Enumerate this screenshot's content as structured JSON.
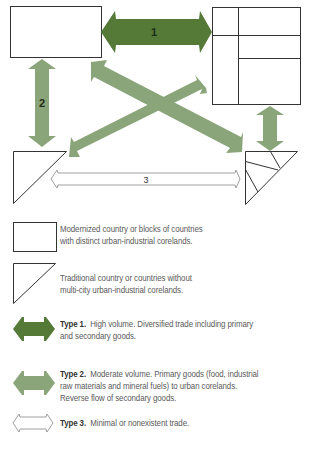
{
  "colors": {
    "type1_fill": "#557a38",
    "type2_fill": "#8ba57a",
    "type3_fill": "#ffffff",
    "outline": "#333333",
    "text": "#5a5a5a"
  },
  "diagram": {
    "arrow_labels": {
      "arrow1": "1",
      "arrow2": "2",
      "arrow3": "3"
    },
    "nodes": [
      {
        "id": "modern-left",
        "shape": "rectangle"
      },
      {
        "id": "modern-right-block",
        "shape": "rectangle-subdivided"
      },
      {
        "id": "traditional-left",
        "shape": "triangle"
      },
      {
        "id": "traditional-right-block",
        "shape": "triangle-subdivided"
      }
    ],
    "links": [
      {
        "from": "modern-left",
        "to": "modern-right-block",
        "type": "1",
        "label": "1"
      },
      {
        "from": "modern-left",
        "to": "traditional-left",
        "type": "2",
        "label": "2"
      },
      {
        "from": "modern-left",
        "to": "traditional-right-block",
        "type": "2",
        "label": ""
      },
      {
        "from": "traditional-left",
        "to": "modern-right-block",
        "type": "2",
        "label": ""
      },
      {
        "from": "modern-right-block",
        "to": "traditional-right-block",
        "type": "2",
        "label": ""
      },
      {
        "from": "traditional-left",
        "to": "traditional-right-block",
        "type": "3",
        "label": "3"
      }
    ]
  },
  "legend": {
    "modern": {
      "line1": "Modernized country or blocks of countries",
      "line2": "with distinct urban-industrial corelands."
    },
    "traditional": {
      "line1": "Traditional country or countries without",
      "line2": "multi-city urban-industrial corelands."
    },
    "type1": {
      "title": "Type 1.",
      "line1": "High volume. Diversified trade including primary",
      "line2": "and secondary goods."
    },
    "type2": {
      "title": "Type 2.",
      "line1": "Moderate volume. Primary goods (food, industrial",
      "line2": "raw materials and mineral fuels) to urban corelands.",
      "line3": "Reverse flow of secondary goods."
    },
    "type3": {
      "title": "Type 3.",
      "line1": "Minimal or nonexistent trade."
    }
  }
}
